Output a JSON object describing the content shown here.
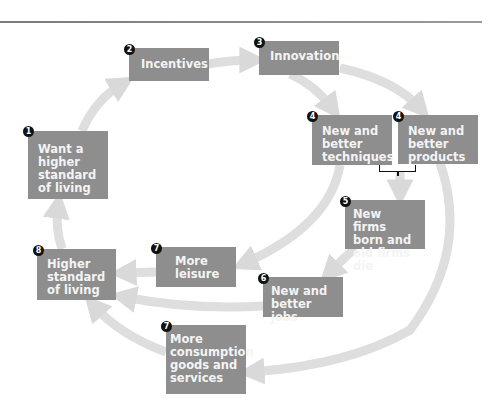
{
  "diagram": {
    "type": "cycle-flow",
    "colors": {
      "box": "#8e8e8e",
      "box_text": "#f4f4f4",
      "arrow": "#dcdcdc",
      "marker": "#111111"
    },
    "nodes": [
      {
        "id": "want",
        "number": "1",
        "label": "Want a higher standard of living",
        "lines": [
          "Want a",
          "higher",
          "standard",
          "of living"
        ]
      },
      {
        "id": "incentives",
        "number": "2",
        "label": "Incentives",
        "lines": [
          "Incentives"
        ]
      },
      {
        "id": "innovation",
        "number": "3",
        "label": "Innovation",
        "lines": [
          "Innovation"
        ]
      },
      {
        "id": "techniques",
        "number": "4",
        "label": "New and better techniques",
        "lines": [
          "New and",
          "better",
          "techniques"
        ]
      },
      {
        "id": "products",
        "number": "4",
        "label": "New and better products",
        "lines": [
          "New and",
          "better",
          "products"
        ]
      },
      {
        "id": "firms",
        "number": "5",
        "label": "New firms born and old firms die",
        "lines": [
          "New firms",
          "born and",
          "old firms die"
        ]
      },
      {
        "id": "jobs",
        "number": "6",
        "label": "New and better jobs",
        "lines": [
          "New and",
          "better jobs"
        ]
      },
      {
        "id": "leisure",
        "number": "7",
        "label": "More leisure",
        "lines": [
          "More",
          "leisure"
        ]
      },
      {
        "id": "consumption",
        "number": "7",
        "label": "More consumption goods and services",
        "lines": [
          "More",
          "consumption",
          "goods and",
          "services"
        ]
      },
      {
        "id": "higher",
        "number": "8",
        "label": "Higher standard of living",
        "lines": [
          "Higher",
          "standard",
          "of living"
        ]
      }
    ],
    "edges": [
      [
        "want",
        "incentives"
      ],
      [
        "incentives",
        "innovation"
      ],
      [
        "innovation",
        "techniques"
      ],
      [
        "innovation",
        "products"
      ],
      [
        "techniques+products",
        "firms"
      ],
      [
        "firms",
        "jobs"
      ],
      [
        "techniques",
        "leisure"
      ],
      [
        "products",
        "consumption"
      ],
      [
        "leisure",
        "higher"
      ],
      [
        "jobs",
        "higher"
      ],
      [
        "consumption",
        "higher"
      ],
      [
        "higher",
        "want"
      ]
    ]
  }
}
